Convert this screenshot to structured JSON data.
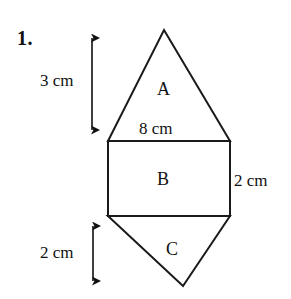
{
  "page": {
    "background_color": "#ffffff",
    "stroke_color": "#1a1a1a",
    "text_color": "#111111",
    "width": 291,
    "height": 299
  },
  "problem": {
    "number": "1."
  },
  "figure": {
    "name": "composite-shape-triangle-rectangle-triangle",
    "regions": [
      {
        "id": "A",
        "label": "A",
        "shape": "triangle",
        "position": "top"
      },
      {
        "id": "B",
        "label": "B",
        "shape": "rectangle",
        "position": "middle"
      },
      {
        "id": "C",
        "label": "C",
        "shape": "triangle",
        "position": "bottom"
      }
    ],
    "dimensions": {
      "top_height": "3 cm",
      "base_width": "8 cm",
      "rectangle_height": "2 cm",
      "bottom_height": "2 cm"
    },
    "geometry": {
      "apex_top": [
        164,
        30
      ],
      "rect_top_left": [
        108,
        141
      ],
      "rect_top_right": [
        230,
        141
      ],
      "rect_bottom_left": [
        108,
        216
      ],
      "rect_bottom_right": [
        230,
        216
      ],
      "apex_bottom": [
        183,
        286
      ]
    },
    "arrows": [
      {
        "id": "top-dimension-arrow",
        "orientation": "vertical",
        "x": 92,
        "y_start": 30,
        "y_end": 137,
        "label": "3 cm"
      },
      {
        "id": "bottom-dimension-arrow",
        "orientation": "vertical",
        "x": 93,
        "y_start": 218,
        "y_end": 288,
        "label": "2 cm"
      }
    ]
  }
}
